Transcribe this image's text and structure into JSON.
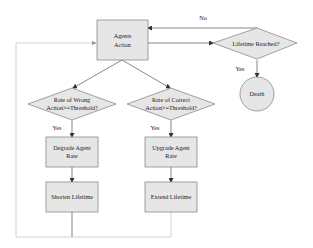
{
  "diagram": {
    "type": "flowchart",
    "nodes": {
      "agents_action": {
        "line1": "Agents",
        "line2": "Action"
      },
      "lifetime_reached": {
        "label": "Lifetime Reached?"
      },
      "death": {
        "label": "Death"
      },
      "wrong_rate": {
        "line1": "Rate of Wrong",
        "line2": "Action>=Threshold?"
      },
      "correct_rate": {
        "line1": "Rate of Correct",
        "line2": "Action>=Threshold?"
      },
      "degrade": {
        "line1": "Degrade Agent",
        "line2": "Rate"
      },
      "shorten": {
        "label": "Shorten Lifetime"
      },
      "upgrade": {
        "line1": "Upgrade Agent",
        "line2": "Rate"
      },
      "extend": {
        "label": "Extend Lifetime"
      }
    },
    "edge_labels": {
      "no": "No",
      "yes_death": "Yes",
      "yes_wrong": "Yes",
      "yes_correct": "Yes"
    },
    "colors": {
      "node_fill": "#e6e6e6",
      "node_stroke": "#8a8a8a",
      "edge": "#555555",
      "loop_edge": "#bdbdbd"
    }
  }
}
